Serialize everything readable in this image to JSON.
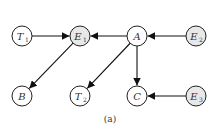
{
  "diagram": {
    "caption": "(a)",
    "colors": {
      "observed_fill": "#e8e8e8",
      "latent_fill": "#ffffff",
      "stroke": "#222222"
    },
    "nodes": [
      {
        "id": "T1",
        "base": "T",
        "sub": "1",
        "observed": false
      },
      {
        "id": "E1",
        "base": "E",
        "sub": "1",
        "observed": true
      },
      {
        "id": "A",
        "base": "A",
        "sub": "",
        "observed": false
      },
      {
        "id": "E2",
        "base": "E",
        "sub": "2",
        "observed": true
      },
      {
        "id": "B",
        "base": "B",
        "sub": "",
        "observed": false
      },
      {
        "id": "T2",
        "base": "T",
        "sub": "2",
        "observed": false
      },
      {
        "id": "C",
        "base": "C",
        "sub": "",
        "observed": false
      },
      {
        "id": "E3",
        "base": "E",
        "sub": "3",
        "observed": true
      }
    ],
    "edges": [
      {
        "from": "T1",
        "to": "E1"
      },
      {
        "from": "A",
        "to": "E1"
      },
      {
        "from": "E2",
        "to": "A"
      },
      {
        "from": "E1",
        "to": "B"
      },
      {
        "from": "A",
        "to": "T2"
      },
      {
        "from": "A",
        "to": "C"
      },
      {
        "from": "E3",
        "to": "C"
      }
    ]
  }
}
